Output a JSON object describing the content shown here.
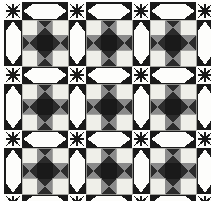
{
  "artwork": {
    "title": "Nine-Patch Star Quilt",
    "type": "quilt-pattern",
    "width": 211,
    "height": 201,
    "background": "#ffffff"
  },
  "palette": {
    "black": "#1a1a1a",
    "dark": "#2b2b2b",
    "charcoal": "#3d3d3d",
    "gray": "#8a8a8a",
    "gray_light": "#9e9e9e",
    "cream": "#efefe9",
    "cream_dim": "#e4e4dc",
    "white": "#fdfdfb",
    "outline": "#b8b8b2"
  },
  "layout": {
    "grid_rows": 3,
    "grid_cols": 3,
    "sash_width": 18,
    "block_size": 46,
    "margin_left": 4,
    "margin_top": 2,
    "cell": 15.33
  },
  "blocks": [
    {
      "id": "block-r1c1",
      "row": 0,
      "col": 0,
      "name": "nine-patch-star"
    },
    {
      "id": "block-r1c2",
      "row": 0,
      "col": 1,
      "name": "nine-patch-star"
    },
    {
      "id": "block-r1c3",
      "row": 0,
      "col": 2,
      "name": "nine-patch-star"
    },
    {
      "id": "block-r2c1",
      "row": 1,
      "col": 0,
      "name": "nine-patch-star"
    },
    {
      "id": "block-r2c2",
      "row": 1,
      "col": 1,
      "name": "nine-patch-star"
    },
    {
      "id": "block-r2c3",
      "row": 1,
      "col": 2,
      "name": "nine-patch-star"
    },
    {
      "id": "block-r3c1",
      "row": 2,
      "col": 0,
      "name": "nine-patch-star"
    },
    {
      "id": "block-r3c2",
      "row": 2,
      "col": 1,
      "name": "nine-patch-star"
    },
    {
      "id": "block-r3c3",
      "row": 2,
      "col": 2,
      "name": "nine-patch-star"
    }
  ],
  "block_pattern": {
    "structure": "3x3 nine-patch",
    "corner_patch": "cream-square",
    "edge_patch": "hourglass-gray-dark",
    "center_patch": "black-square",
    "hourglass_vertical_color": "#2b2b2b",
    "hourglass_horizontal_color": "#8a8a8a"
  },
  "sashing": {
    "name": "black-sashing-with-white-lens",
    "strip_color": "#1a1a1a",
    "lens_color": "#fdfdfb",
    "horizontal_count": 12,
    "vertical_count": 12
  },
  "intersections": {
    "name": "eight-point-star",
    "star_color": "#1a1a1a",
    "field_color": "#fdfdfb",
    "count": 16
  }
}
